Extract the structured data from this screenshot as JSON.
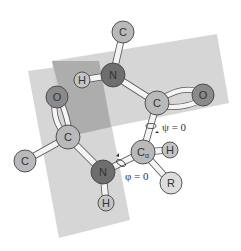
{
  "diagram": {
    "planes": [
      {
        "id": "plane-right",
        "color": "#c8c8c8"
      },
      {
        "id": "plane-left",
        "color": "#c8c8c8"
      },
      {
        "id": "plane-overlap",
        "color": "#a8a8a8"
      }
    ],
    "atoms": [
      {
        "id": "c-top",
        "label": "C",
        "x": 123,
        "y": 32,
        "r": 11,
        "fill": "#b9b9b9"
      },
      {
        "id": "n-top",
        "label": "N",
        "x": 113,
        "y": 75,
        "r": 12,
        "fill": "#6e6e6e"
      },
      {
        "id": "h-left",
        "label": "H",
        "x": 82,
        "y": 80,
        "r": 8,
        "fill": "#c4c4c4"
      },
      {
        "id": "c-right",
        "label": "C",
        "x": 157,
        "y": 103,
        "r": 12,
        "fill": "#b9b9b9"
      },
      {
        "id": "o-right",
        "label": "O",
        "x": 203,
        "y": 95,
        "r": 11,
        "fill": "#8a8a8a"
      },
      {
        "id": "o-left",
        "label": "O",
        "x": 57,
        "y": 97,
        "r": 11,
        "fill": "#8a8a8a"
      },
      {
        "id": "c-left",
        "label": "C",
        "x": 68,
        "y": 137,
        "r": 12,
        "fill": "#b9b9b9"
      },
      {
        "id": "c-far-left",
        "label": "C",
        "x": 25,
        "y": 161,
        "r": 11,
        "fill": "#b9b9b9"
      },
      {
        "id": "n-bottom",
        "label": "N",
        "x": 103,
        "y": 172,
        "r": 12,
        "fill": "#6e6e6e"
      },
      {
        "id": "h-bottom",
        "label": "H",
        "x": 106,
        "y": 203,
        "r": 8,
        "fill": "#c4c4c4"
      },
      {
        "id": "c-alpha",
        "label": "C",
        "sub": "α",
        "x": 143,
        "y": 152,
        "r": 12,
        "fill": "#b9b9b9"
      },
      {
        "id": "h-right",
        "label": "H",
        "x": 170,
        "y": 150,
        "r": 8,
        "fill": "#c4c4c4"
      },
      {
        "id": "r-group",
        "label": "R",
        "x": 171,
        "y": 183,
        "r": 11,
        "fill": "#dcdcdc"
      }
    ],
    "annotations": {
      "psi": "ψ = 0",
      "phi": "φ = 0"
    }
  }
}
